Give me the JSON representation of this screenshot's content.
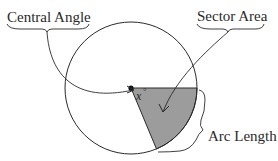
{
  "diagram": {
    "labels": {
      "central_angle": "Central Angle",
      "sector_area": "Sector Area",
      "arc_length": "Arc Length",
      "angle_var": "x",
      "angle_unit": "°"
    },
    "colors": {
      "stroke": "#2a2a2a",
      "sector_fill": "#9c9c9c",
      "background": "#ffffff"
    }
  }
}
